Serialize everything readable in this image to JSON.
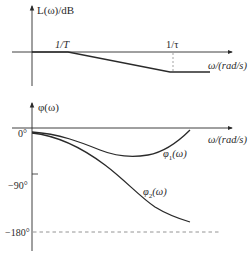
{
  "diagram": {
    "type": "bode_plot",
    "magnitude_plot": {
      "y_label": "L(ω)/dB",
      "x_label": "ω/(rad/s)",
      "breakpoints": [
        {
          "label": "1/T",
          "x": 68
        },
        {
          "label": "1/τ",
          "x": 173
        }
      ],
      "segments": [
        {
          "from": [
            12,
            52
          ],
          "to": [
            68,
            52
          ],
          "slope": "0"
        },
        {
          "from": [
            68,
            52
          ],
          "to": [
            170,
            72
          ],
          "slope": "negative"
        },
        {
          "from": [
            170,
            72
          ],
          "to": [
            210,
            72
          ],
          "slope": "0"
        }
      ]
    },
    "phase_plot": {
      "y_label": "φ(ω)",
      "x_label": "ω/(rad/s)",
      "ticks": [
        {
          "label": "0°",
          "y": 133
        },
        {
          "label": "−90°",
          "y": 175
        },
        {
          "label": "−180°",
          "y": 232
        }
      ],
      "curves": [
        {
          "name": "φ1",
          "label_main": "φ",
          "label_sub": "1",
          "label_tail": "(ω)",
          "description": "phase dips to a minimum then returns toward 0°"
        },
        {
          "name": "φ2",
          "label_main": "φ",
          "label_sub": "2",
          "label_tail": "(ω)",
          "description": "phase decreases monotonically toward −180°"
        }
      ]
    },
    "colors": {
      "line": "#2a2a2a",
      "dash": "#888888"
    }
  }
}
